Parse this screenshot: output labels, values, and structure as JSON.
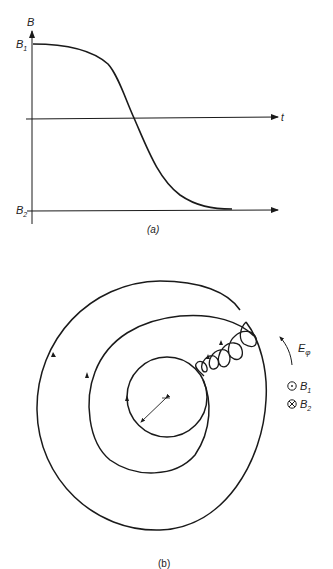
{
  "panel_a": {
    "caption": "(a)",
    "y_axis_label": "B",
    "x_axis_label": "t",
    "level_high_label": "B",
    "level_high_sub": "1",
    "level_low_label": "B",
    "level_low_sub": "2",
    "curve": "B(t) decreasing smoothly from B1 to B2 (tanh-like), crossing zero at mid time"
  },
  "panel_b": {
    "caption": "(b)",
    "field_label": "E",
    "field_sub": "φ",
    "legend": [
      {
        "symbol": "⊙",
        "label": "B",
        "sub": "1",
        "meaning": "field out of page"
      },
      {
        "symbol": "⊗",
        "label": "B",
        "sub": "2",
        "meaning": "field into page"
      }
    ],
    "description": "Charged particle orbit spiralling outward from small circle to large circle with small gyration loops during field reversal"
  },
  "colors": {
    "ink": "#1a1a1a",
    "background": "#ffffff"
  }
}
